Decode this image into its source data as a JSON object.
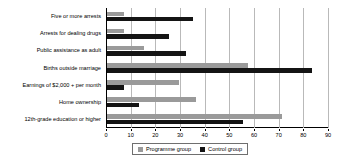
{
  "chart_data": {
    "type": "bar",
    "orientation": "horizontal",
    "title": "",
    "xlabel": "",
    "ylabel": "",
    "xlim": [
      0,
      90
    ],
    "xticks": [
      0,
      10,
      20,
      30,
      40,
      50,
      60,
      70,
      80,
      90
    ],
    "grid": true,
    "legend_position": "bottom",
    "categories": [
      "Five or more arrests",
      "Arrests for dealing drugs",
      "Public assistance as adult",
      "Births outside marriage",
      "Earnings of $2,000 + per month",
      "Home ownership",
      "12th-grade education or higher"
    ],
    "series": [
      {
        "name": "Programme group",
        "color": "#9a9a9a",
        "values": [
          7,
          7,
          15,
          57,
          29,
          36,
          71
        ]
      },
      {
        "name": "Control group",
        "color": "#141414",
        "values": [
          35,
          25,
          32,
          83,
          7,
          13,
          55
        ]
      }
    ]
  }
}
